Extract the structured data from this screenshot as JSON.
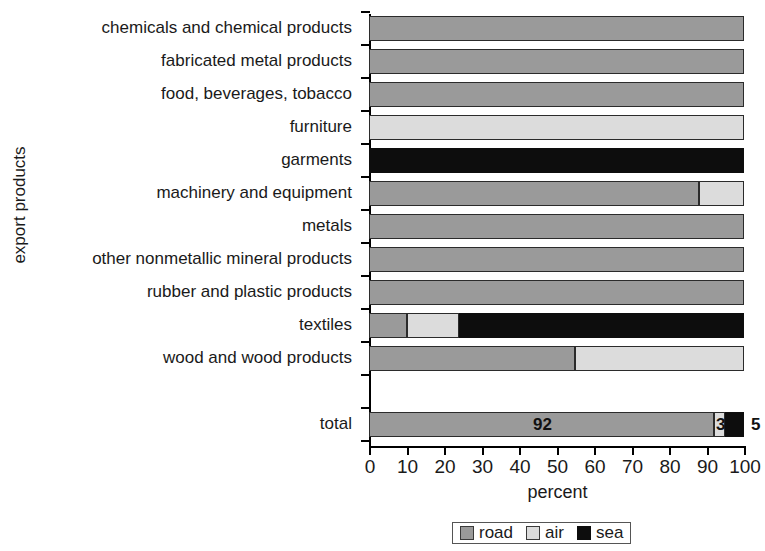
{
  "chart_data": {
    "type": "bar",
    "orientation": "horizontal",
    "stacked": true,
    "title": "",
    "xlabel": "percent",
    "ylabel": "export products",
    "xlim": [
      0,
      100
    ],
    "xticks": [
      0,
      10,
      20,
      30,
      40,
      50,
      60,
      70,
      80,
      90,
      100
    ],
    "xticklabels": [
      "0",
      "10",
      "20",
      "30",
      "40",
      "50",
      "60",
      "70",
      "80",
      "90",
      "100"
    ],
    "grid": false,
    "legend_position": "bottom-center",
    "categories": [
      "chemicals and chemical products",
      "fabricated metal products",
      "food, beverages, tobacco",
      "furniture",
      "garments",
      "machinery and equipment",
      "metals",
      "other nonmetallic mineral products",
      "rubber and plastic products",
      "textiles",
      "wood and wood products",
      "",
      "total"
    ],
    "series": [
      {
        "name": "road",
        "color": "#9a9a9a",
        "values": [
          100,
          100,
          100,
          0,
          0,
          88,
          100,
          100,
          100,
          10,
          55,
          0,
          92
        ]
      },
      {
        "name": "air",
        "color": "#dcdcdc",
        "values": [
          0,
          0,
          0,
          100,
          0,
          12,
          0,
          0,
          0,
          14,
          45,
          0,
          3
        ]
      },
      {
        "name": "sea",
        "color": "#0d0d0d",
        "values": [
          0,
          0,
          0,
          0,
          100,
          0,
          0,
          0,
          0,
          76,
          0,
          0,
          5
        ]
      }
    ],
    "data_labels": {
      "total": {
        "road": "92",
        "air": "3",
        "sea": "5"
      }
    }
  },
  "legend": {
    "items": [
      {
        "label": "road",
        "swatch": "road-swatch"
      },
      {
        "label": "air",
        "swatch": "air-swatch"
      },
      {
        "label": "sea",
        "swatch": "sea-swatch"
      }
    ]
  }
}
